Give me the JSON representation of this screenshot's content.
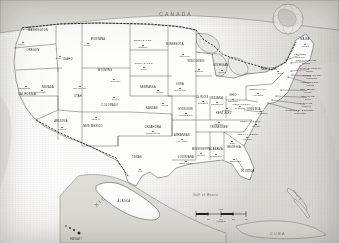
{
  "map": {
    "title_countries": {
      "canada": "CANADA",
      "mexico": "MEXICO",
      "cuba": "CUBA",
      "bahamas": "THE BAHAMAS"
    },
    "ocean_labels": {
      "gulf": "Gulf of Mexico",
      "pacific": "Pacific Ocean",
      "atlantic": "Atlantic Ocean"
    },
    "insets": {
      "alaska_label": "ALASKA",
      "hawaii_label": "HAWAII",
      "globe_name": "globe-locator-inset"
    },
    "scale": {
      "unit_label": "Miles",
      "ticks": [
        "0",
        "100",
        "200",
        "300",
        "400"
      ],
      "secondary_unit": "Kilometers"
    },
    "states": [
      {
        "name": "WASHINGTON",
        "capital": "Olympia",
        "x": 38,
        "y": 31,
        "cx": 28,
        "cy": 29,
        "cap_anchor": "end"
      },
      {
        "name": "OREGON",
        "capital": "Salem",
        "x": 33,
        "y": 51,
        "cx": 23,
        "cy": 44,
        "cap_anchor": "end"
      },
      {
        "name": "IDAHO",
        "capital": "Boise",
        "x": 68,
        "y": 60,
        "cx": 60,
        "cy": 58,
        "cap_anchor": "end"
      },
      {
        "name": "MONTANA",
        "capital": "Helena",
        "x": 98,
        "y": 40,
        "cx": 88,
        "cy": 45,
        "cap_anchor": "end"
      },
      {
        "name": "NORTH DAKOTA",
        "capital": "Bismarck",
        "x": 143,
        "y": 41,
        "cx": 143,
        "cy": 47,
        "cap_anchor": "middle"
      },
      {
        "name": "SOUTH DAKOTA",
        "capital": "Pierre",
        "x": 144,
        "y": 64,
        "cx": 144,
        "cy": 69,
        "cap_anchor": "middle"
      },
      {
        "name": "WYOMING",
        "capital": "Cheyenne",
        "x": 105,
        "y": 71,
        "cx": 114,
        "cy": 81,
        "cap_anchor": "start"
      },
      {
        "name": "NEBRASKA",
        "capital": "Lincoln",
        "x": 148,
        "y": 88,
        "cx": 158,
        "cy": 92,
        "cap_anchor": "start"
      },
      {
        "name": "CALIFORNIA",
        "capital": "Sacramento",
        "x": 27,
        "y": 95,
        "cx": 26,
        "cy": 88,
        "cap_anchor": "end"
      },
      {
        "name": "NEVADA",
        "capital": "Carson City",
        "x": 48,
        "y": 88,
        "cx": 42,
        "cy": 92,
        "cap_anchor": "end"
      },
      {
        "name": "UTAH",
        "capital": "Salt Lake City",
        "x": 78,
        "y": 97,
        "cx": 80,
        "cy": 88,
        "cap_anchor": "middle"
      },
      {
        "name": "COLORADO",
        "capital": "Denver",
        "x": 110,
        "y": 106,
        "cx": 114,
        "cy": 99,
        "cap_anchor": "start"
      },
      {
        "name": "KANSAS",
        "capital": "Topeka",
        "x": 152,
        "y": 109,
        "cx": 163,
        "cy": 105,
        "cap_anchor": "start"
      },
      {
        "name": "ARIZONA",
        "capital": "Phoenix",
        "x": 61,
        "y": 122,
        "cx": 62,
        "cy": 129,
        "cap_anchor": "middle"
      },
      {
        "name": "NEW MEXICO",
        "capital": "Santa Fe",
        "x": 93,
        "y": 127,
        "cx": 96,
        "cy": 119,
        "cap_anchor": "middle"
      },
      {
        "name": "OKLAHOMA",
        "capital": "Oklahoma City",
        "x": 153,
        "y": 128,
        "cx": 153,
        "cy": 133,
        "cap_anchor": "middle"
      },
      {
        "name": "TEXAS",
        "capital": "Austin",
        "x": 137,
        "y": 158,
        "cx": 140,
        "cy": 171,
        "cap_anchor": "middle"
      },
      {
        "name": "MINNESOTA",
        "capital": "Saint Paul",
        "x": 175,
        "y": 45,
        "cx": 183,
        "cy": 56,
        "cap_anchor": "start"
      },
      {
        "name": "IOWA",
        "capital": "Des Moines",
        "x": 180,
        "y": 85,
        "cx": 180,
        "cy": 90,
        "cap_anchor": "middle"
      },
      {
        "name": "MISSOURI",
        "capital": "Jefferson City",
        "x": 186,
        "y": 110,
        "cx": 186,
        "cy": 115,
        "cap_anchor": "middle"
      },
      {
        "name": "ARKANSAS",
        "capital": "Little Rock",
        "x": 182,
        "y": 136,
        "cx": 182,
        "cy": 141,
        "cap_anchor": "middle"
      },
      {
        "name": "LOUISIANA",
        "capital": "Baton Rouge",
        "x": 186,
        "y": 158,
        "cx": 186,
        "cy": 163,
        "cap_anchor": "middle"
      },
      {
        "name": "WISCONSIN",
        "capital": "Madison",
        "x": 196,
        "y": 62,
        "cx": 199,
        "cy": 71,
        "cap_anchor": "middle"
      },
      {
        "name": "ILLINOIS",
        "capital": "Springfield",
        "x": 202,
        "y": 98,
        "cx": 203,
        "cy": 103,
        "cap_anchor": "middle"
      },
      {
        "name": "MICHIGAN",
        "capital": "Lansing",
        "x": 221,
        "y": 66,
        "cx": 222,
        "cy": 72,
        "cap_anchor": "middle"
      },
      {
        "name": "INDIANA",
        "capital": "Indianapolis",
        "x": 217,
        "y": 99,
        "cx": 217,
        "cy": 104,
        "cap_anchor": "middle"
      },
      {
        "name": "OHIO",
        "capital": "Columbus",
        "x": 233,
        "y": 96,
        "cx": 233,
        "cy": 101,
        "cap_anchor": "middle"
      },
      {
        "name": "KENTUCKY",
        "capital": "Frankfort",
        "x": 224,
        "y": 114,
        "cx": 227,
        "cy": 110,
        "cap_anchor": "middle"
      },
      {
        "name": "TENNESSEE",
        "capital": "Nashville",
        "x": 219,
        "y": 128,
        "cx": 219,
        "cy": 124,
        "cap_anchor": "middle"
      },
      {
        "name": "MISSISSIPPI",
        "capital": "Jackson",
        "x": 201,
        "y": 150,
        "cx": 201,
        "cy": 155,
        "cap_anchor": "middle"
      },
      {
        "name": "ALABAMA",
        "capital": "Montgomery",
        "x": 216,
        "y": 150,
        "cx": 216,
        "cy": 156,
        "cap_anchor": "middle"
      },
      {
        "name": "GEORGIA",
        "capital": "Atlanta",
        "x": 234,
        "y": 148,
        "cx": 232,
        "cy": 143,
        "cap_anchor": "middle"
      },
      {
        "name": "FLORIDA",
        "capital": "Tallahassee",
        "x": 248,
        "y": 172,
        "cx": 234,
        "cy": 161,
        "cap_anchor": "start"
      },
      {
        "name": "SOUTH CAROLINA",
        "capital": "Columbia",
        "x": 248,
        "y": 135,
        "cx": 247,
        "cy": 139,
        "cap_anchor": "middle"
      },
      {
        "name": "NORTH CAROLINA",
        "capital": "Raleigh",
        "x": 251,
        "y": 122,
        "cx": 256,
        "cy": 126,
        "cap_anchor": "middle"
      },
      {
        "name": "VIRGINIA",
        "capital": "Richmond",
        "x": 254,
        "y": 110,
        "cx": 261,
        "cy": 113,
        "cap_anchor": "start"
      },
      {
        "name": "WEST VIRGINIA",
        "capital": "Charleston",
        "x": 242,
        "y": 105,
        "cx": 240,
        "cy": 108,
        "cap_anchor": "middle"
      },
      {
        "name": "PENNSYLVANIA",
        "capital": "Harrisburg",
        "x": 258,
        "y": 90,
        "cx": 258,
        "cy": 95,
        "cap_anchor": "middle"
      },
      {
        "name": "NEW YORK",
        "capital": "Albany",
        "x": 269,
        "y": 70,
        "cx": 278,
        "cy": 73,
        "cap_anchor": "start"
      },
      {
        "name": "MAINE",
        "capital": "Augusta",
        "x": 305,
        "y": 40,
        "cx": 305,
        "cy": 46,
        "cap_anchor": "middle"
      }
    ],
    "callout_states": [
      {
        "name": "VERMONT",
        "capital": "Montpelier",
        "lx": 300,
        "ly": 56,
        "px": 286,
        "py": 60
      },
      {
        "name": "NEW HAMPSHIRE",
        "capital": "Concord",
        "lx": 306,
        "ly": 62,
        "px": 291,
        "py": 63
      },
      {
        "name": "MASSACHUSETTS",
        "capital": "Boston",
        "lx": 310,
        "ly": 70,
        "px": 291,
        "py": 71
      },
      {
        "name": "RHODE ISLAND",
        "capital": "Providence",
        "lx": 312,
        "ly": 77,
        "px": 292,
        "py": 75
      },
      {
        "name": "CONNECTICUT",
        "capital": "Hartford",
        "lx": 310,
        "ly": 84,
        "px": 288,
        "py": 77
      },
      {
        "name": "NEW JERSEY",
        "capital": "Trenton",
        "lx": 308,
        "ly": 91,
        "px": 281,
        "py": 90
      },
      {
        "name": "DELAWARE",
        "capital": "Dover",
        "lx": 308,
        "ly": 98,
        "px": 276,
        "py": 96
      },
      {
        "name": "MARYLAND",
        "capital": "Annapolis",
        "lx": 306,
        "ly": 105,
        "px": 272,
        "py": 100
      },
      {
        "name": "DISTRICT OF COLUMBIA",
        "capital": "Washington",
        "lx": 300,
        "ly": 112,
        "px": 268,
        "py": 103
      }
    ]
  }
}
